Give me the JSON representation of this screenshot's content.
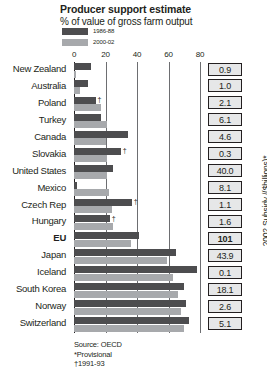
{
  "header": {
    "title": "Producer support estimate",
    "subtitle": "% of value of gross farm output"
  },
  "legend": [
    {
      "label": "1986-88",
      "color": "#4d4d4f"
    },
    {
      "label": "2000-02",
      "color": "#a7a9ac"
    }
  ],
  "axis_title_right": "2002 Subsidy /($billions)*",
  "notes": [
    "Source: OECD",
    "*Provisional",
    "†1991-93"
  ],
  "dagger": "†",
  "chart_data": {
    "type": "bar",
    "orientation": "horizontal",
    "title": "Producer support estimate",
    "subtitle": "% of value of gross farm output",
    "xlabel": "",
    "ylabel": "",
    "xlim": [
      0,
      80
    ],
    "xticks": [
      0,
      20,
      40,
      60,
      80
    ],
    "grid": true,
    "legend_position": "top-left",
    "categories": [
      "New Zealand",
      "Australia",
      "Poland",
      "Turkey",
      "Canada",
      "Slovakia",
      "United States",
      "Mexico",
      "Czech Rep",
      "Hungary",
      "EU",
      "Japan",
      "Iceland",
      "South Korea",
      "Norway",
      "Switzerland"
    ],
    "series": [
      {
        "name": "1986-88",
        "color": "#4d4d4f",
        "values": [
          11,
          9,
          14,
          17,
          34,
          30,
          25,
          2,
          37,
          23,
          41,
          65,
          78,
          70,
          71,
          73
        ]
      },
      {
        "name": "2000-02",
        "color": "#a7a9ac",
        "values": [
          1,
          4,
          17,
          21,
          20,
          21,
          21,
          22,
          24,
          25,
          36,
          59,
          63,
          66,
          68,
          70
        ]
      }
    ],
    "footnote_marks": {
      "Poland": "†",
      "Slovakia": "†",
      "Czech Rep": "†",
      "Hungary": "†"
    },
    "bold_categories": [
      "EU"
    ],
    "side_values": {
      "label": "2002 Subsidy /($billions)*",
      "values": [
        "0.9",
        "1.0",
        "2.1",
        "6.1",
        "4.6",
        "0.3",
        "40.0",
        "8.1",
        "1.1",
        "1.6",
        "101",
        "43.9",
        "0.1",
        "18.1",
        "2.6",
        "5.1"
      ],
      "bold": [
        "101"
      ]
    }
  }
}
